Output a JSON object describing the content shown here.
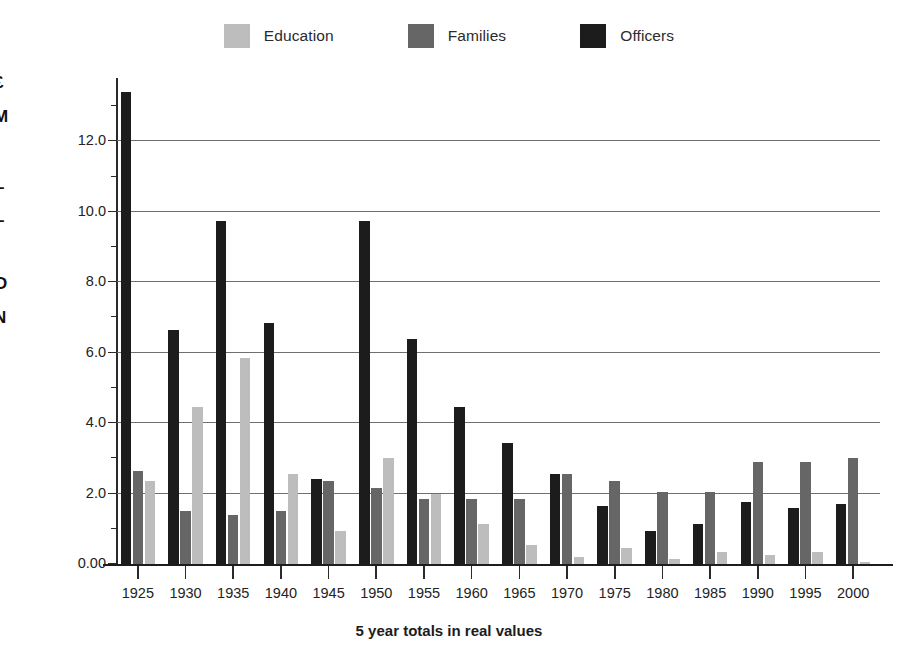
{
  "legend": {
    "entries": [
      {
        "label": "Education",
        "color": "#bdbdbd",
        "key": "education"
      },
      {
        "label": "Families",
        "color": "#666666",
        "key": "families"
      },
      {
        "label": "Officers",
        "color": "#1c1c1c",
        "key": "officers"
      }
    ]
  },
  "axes": {
    "y_title_lines": [
      "£",
      "M",
      "I",
      "L",
      "L",
      "I",
      "O",
      "N"
    ],
    "y_title_text": "£ MILLION",
    "y_tick_labels": [
      "0.00",
      "2.0",
      "4.0",
      "6.0",
      "8.0",
      "10.0",
      "12.0"
    ],
    "x_title": "5 year totals in real values"
  },
  "chart_data": {
    "type": "bar",
    "title": "",
    "subtitle": "",
    "xlabel": "5 year totals in real values",
    "ylabel": "£ MILLION",
    "ylim": [
      0,
      13.8
    ],
    "yticks": [
      0,
      2,
      4,
      6,
      8,
      10,
      12
    ],
    "ytick_labels": [
      "0.00",
      "2.0",
      "4.0",
      "6.0",
      "8.0",
      "10.0",
      "12.0"
    ],
    "grid": true,
    "grid_axis": "y",
    "legend_position": "top-center",
    "bar_order": [
      "Officers",
      "Families",
      "Education"
    ],
    "categories": [
      "1925",
      "1930",
      "1935",
      "1940",
      "1945",
      "1950",
      "1955",
      "1960",
      "1965",
      "1970",
      "1975",
      "1980",
      "1985",
      "1990",
      "1995",
      "2000"
    ],
    "series": [
      {
        "name": "Education",
        "color": "#bdbdbd",
        "values": [
          2.35,
          4.45,
          5.85,
          2.55,
          0.95,
          3.0,
          2.0,
          1.15,
          0.55,
          0.2,
          0.45,
          0.15,
          0.35,
          0.25,
          0.35,
          0.05
        ]
      },
      {
        "name": "Families",
        "color": "#666666",
        "values": [
          2.65,
          1.5,
          1.4,
          1.5,
          2.35,
          2.15,
          1.85,
          1.85,
          1.85,
          2.55,
          2.35,
          2.05,
          2.05,
          2.9,
          2.9,
          3.0
        ]
      },
      {
        "name": "Officers",
        "color": "#1c1c1c",
        "values": [
          13.4,
          6.65,
          9.75,
          6.85,
          2.4,
          9.75,
          6.4,
          4.45,
          3.45,
          2.55,
          1.65,
          0.95,
          1.15,
          1.75,
          1.6,
          1.7
        ]
      }
    ]
  }
}
